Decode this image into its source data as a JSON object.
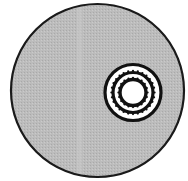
{
  "diagram": {
    "canvas": {
      "width": 188,
      "height": 181,
      "background": "#ffffff"
    },
    "outer_disc": {
      "cx": 97.5,
      "cy": 90.5,
      "r": 86.5,
      "fill": "#b9b9b9",
      "stroke": "#1a1a1a",
      "stroke_width": 2.2
    },
    "light_band": {
      "x": 77,
      "width": 5,
      "color": "#c8c8c8"
    },
    "target": {
      "cx": 133,
      "cy": 92.5,
      "rings": [
        {
          "name": "outer-ring",
          "r": 28,
          "fill": "#ffffff",
          "stroke": "#111111",
          "stroke_width": 3.2
        },
        {
          "name": "beaded-ring",
          "r": 20,
          "fill": "none",
          "stroke": "#111111",
          "stroke_width": 3.2,
          "beads": 28
        },
        {
          "name": "inner-ring",
          "r": 13,
          "fill": "#ffffff",
          "stroke": "#111111",
          "stroke_width": 3.4,
          "beads": 20
        }
      ],
      "center_fill": "#ffffff"
    }
  }
}
